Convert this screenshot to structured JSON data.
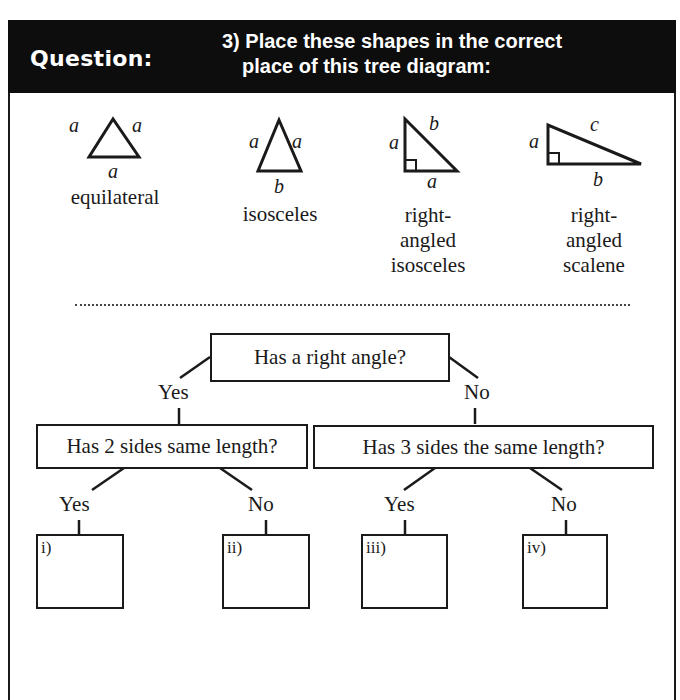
{
  "header": {
    "label": "Question:",
    "question_line1": "3) Place these shapes in the correct",
    "question_line2": "place of this tree diagram:"
  },
  "shapes": [
    {
      "name": "equilateral",
      "sides": {
        "left": "a",
        "right": "a",
        "bottom": "a"
      }
    },
    {
      "name": "isosceles",
      "sides": {
        "left": "a",
        "right": "a",
        "bottom": "b"
      }
    },
    {
      "name_lines": [
        "right-",
        "angled",
        "isosceles"
      ],
      "sides": {
        "left": "a",
        "hyp": "b",
        "bottom": "a"
      }
    },
    {
      "name_lines": [
        "right-",
        "angled",
        "scalene"
      ],
      "sides": {
        "left": "a",
        "hyp": "c",
        "bottom": "b"
      }
    }
  ],
  "tree": {
    "root": "Has a right angle?",
    "root_yes": "Yes",
    "root_no": "No",
    "left_node": "Has 2 sides same length?",
    "right_node": "Has 3 sides the same length?",
    "left_yes": "Yes",
    "left_no": "No",
    "right_yes": "Yes",
    "right_no": "No",
    "answers": [
      "i)",
      "ii)",
      "iii)",
      "iv)"
    ]
  },
  "colors": {
    "ink": "#1a1a1a",
    "header_bg": "#0d0d0d",
    "header_text": "#ffffff"
  }
}
